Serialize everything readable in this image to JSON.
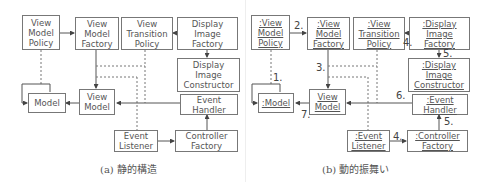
{
  "figure": {
    "static_structure": {
      "caption": "(a) 静的構造",
      "boxes": {
        "view_model_policy": "View\nModel\nPolicy",
        "view_model_factory": "View\nModel\nFactory",
        "view_transition_policy": "View\nTransition\nPolicy",
        "display_image_factory": "Display\nImage\nFactory",
        "display_image_constructor": "Display\nImage\nConstructor",
        "model": "Model",
        "view_model": "View\nModel",
        "event_handler": "Event\nHandler",
        "event_listener": "Event\nListener",
        "controller_factory": "Controller\nFactory"
      }
    },
    "dynamic_behavior": {
      "caption": "(b) 動的振舞い",
      "boxes": {
        "view_model_policy": ":View\nModel\nPolicy",
        "view_model_factory": ":View\nModel\nFactory",
        "view_transition_policy": ":View\nTransition\nPolicy",
        "display_image_factory": ":Display\nImage\nFactory",
        "display_image_constructor": ":Display\nImage\nConstructor",
        "model": ":Model",
        "view_model": "View\nModel",
        "event_handler": ":Event\nHandler",
        "event_listener": ":Event\nListener",
        "controller_factory": ":Controller\nFactory"
      },
      "step_labels": {
        "s1": "1.",
        "s2": "2.",
        "s3": "3.",
        "s4a": "4.",
        "s4b": "4.",
        "s5a": "5.",
        "s5b": "5.",
        "s6": "6.",
        "s7": "7."
      }
    }
  }
}
